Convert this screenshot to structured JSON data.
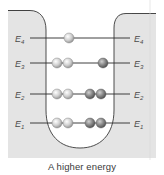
{
  "figure": {
    "caption": "A higher energy",
    "colors": {
      "panel": "#e4e4e4",
      "well_interior": "#ffffff",
      "outline": "#3a3a3a",
      "level_line": "#2a2a2a",
      "light_particle": "#d8d8d8",
      "dark_particle": "#8a8a8a"
    },
    "levels": [
      {
        "name": "E4",
        "letter": "E",
        "sub": "4",
        "y": 38,
        "light_particles": 1,
        "dark_particles": 0
      },
      {
        "name": "E3",
        "letter": "E",
        "sub": "3",
        "y": 63,
        "light_particles": 2,
        "dark_particles": 1
      },
      {
        "name": "E2",
        "letter": "E",
        "sub": "2",
        "y": 94,
        "light_particles": 2,
        "dark_particles": 2
      },
      {
        "name": "E1",
        "letter": "E",
        "sub": "1",
        "y": 123,
        "light_particles": 2,
        "dark_particles": 2
      }
    ]
  }
}
